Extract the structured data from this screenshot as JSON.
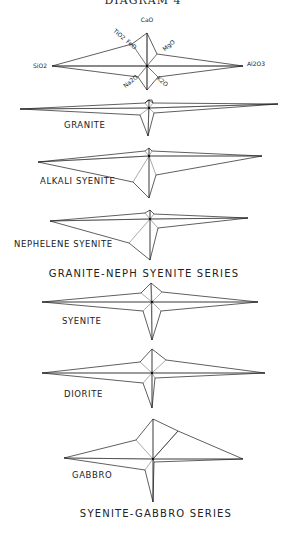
{
  "figure": {
    "header_title": "DIAGRAM 4",
    "key": {
      "center": [
        147,
        66
      ],
      "axis_labels": [
        {
          "text": "CaO",
          "x": 147,
          "y": 22,
          "rotate": 0
        },
        {
          "text": "TiO2",
          "x": 118,
          "y": 36,
          "rotate": 40
        },
        {
          "text": "FeO",
          "x": 130,
          "y": 46,
          "rotate": 40
        },
        {
          "text": "MgO",
          "x": 170,
          "y": 47,
          "rotate": -40
        },
        {
          "text": "SiO2",
          "x": 40,
          "y": 68,
          "rotate": 0
        },
        {
          "text": "Al2O3",
          "x": 256,
          "y": 66,
          "rotate": 0
        },
        {
          "text": "Na2O",
          "x": 132,
          "y": 83,
          "rotate": -40
        },
        {
          "text": "K2O",
          "x": 161,
          "y": 83,
          "rotate": 40
        }
      ],
      "polygon": [
        [
          147,
          33
        ],
        [
          132,
          44
        ],
        [
          52,
          66
        ],
        [
          138,
          77
        ],
        [
          147,
          90
        ],
        [
          158,
          77
        ],
        [
          243,
          66
        ],
        [
          157,
          54
        ]
      ],
      "axes": [
        [
          147,
          33
        ],
        [
          132,
          44
        ],
        [
          52,
          66
        ],
        [
          138,
          77
        ],
        [
          147,
          90
        ],
        [
          158,
          77
        ],
        [
          243,
          66
        ],
        [
          157,
          54
        ]
      ]
    },
    "diagrams": [
      {
        "name": "GRANITE",
        "label": "GRANITE",
        "label_pos": [
          64,
          128
        ],
        "center": [
          149,
          108
        ],
        "polygon": [
          [
            149,
            100
          ],
          [
            145,
            103
          ],
          [
            20,
            109
          ],
          [
            140,
            115
          ],
          [
            148,
            136
          ],
          [
            154,
            113
          ],
          [
            278,
            104
          ],
          [
            153,
            103
          ]
        ],
        "extra": [
          [
            [
              145,
              103
            ],
            [
              148,
              100
            ],
            [
              152,
              100
            ],
            [
              153,
              103
            ]
          ]
        ]
      },
      {
        "name": "ALKALI SYENITE",
        "label": "ALKALI SYENITE",
        "label_pos": [
          40,
          184
        ],
        "center": [
          149,
          156
        ],
        "polygon": [
          [
            149,
            148
          ],
          [
            145,
            151
          ],
          [
            38,
            162
          ],
          [
            133,
            182
          ],
          [
            149,
            198
          ],
          [
            156,
            175
          ],
          [
            262,
            156
          ],
          [
            152,
            151
          ]
        ],
        "extra": []
      },
      {
        "name": "NEPHELENE SYENITE",
        "label": "NEPHELENE SYENITE",
        "label_pos": [
          14,
          247
        ],
        "center": [
          150,
          219
        ],
        "polygon": [
          [
            150,
            210
          ],
          [
            145,
            213
          ],
          [
            50,
            221
          ],
          [
            129,
            243
          ],
          [
            150,
            260
          ],
          [
            158,
            228
          ],
          [
            248,
            218
          ],
          [
            154,
            214
          ]
        ],
        "extra": []
      },
      {
        "name": "SYENITE",
        "label": "SYENITE",
        "label_pos": [
          62,
          324
        ],
        "center": [
          152,
          302
        ],
        "polygon": [
          [
            151,
            283
          ],
          [
            141,
            293
          ],
          [
            42,
            302
          ],
          [
            143,
            311
          ],
          [
            152,
            340
          ],
          [
            161,
            311
          ],
          [
            258,
            302
          ],
          [
            162,
            292
          ]
        ],
        "extra": []
      },
      {
        "name": "DIORITE",
        "label": "DIORITE",
        "label_pos": [
          64,
          397
        ],
        "center": [
          152,
          373
        ],
        "polygon": [
          [
            152,
            349
          ],
          [
            140,
            362
          ],
          [
            42,
            373
          ],
          [
            143,
            383
          ],
          [
            152,
            408
          ],
          [
            155,
            378
          ],
          [
            265,
            373
          ],
          [
            166,
            360
          ]
        ],
        "extra": []
      },
      {
        "name": "GABBRO",
        "label": "GABBRO",
        "label_pos": [
          72,
          478
        ],
        "center": [
          153,
          459
        ],
        "polygon": [
          [
            153,
            419
          ],
          [
            136,
            440
          ],
          [
            64,
            458
          ],
          [
            145,
            470
          ],
          [
            153,
            502
          ],
          [
            154,
            462
          ],
          [
            243,
            459
          ],
          [
            178,
            431
          ]
        ],
        "extra": [
          [
            [
              153,
              459
            ],
            [
              178,
              431
            ]
          ]
        ]
      }
    ],
    "series_labels": [
      {
        "text": "GRANITE-NEPH SYENITE SERIES",
        "x": 144,
        "y": 277
      },
      {
        "text": "SYENITE-GABBRO SERIES",
        "x": 156,
        "y": 517
      }
    ]
  }
}
